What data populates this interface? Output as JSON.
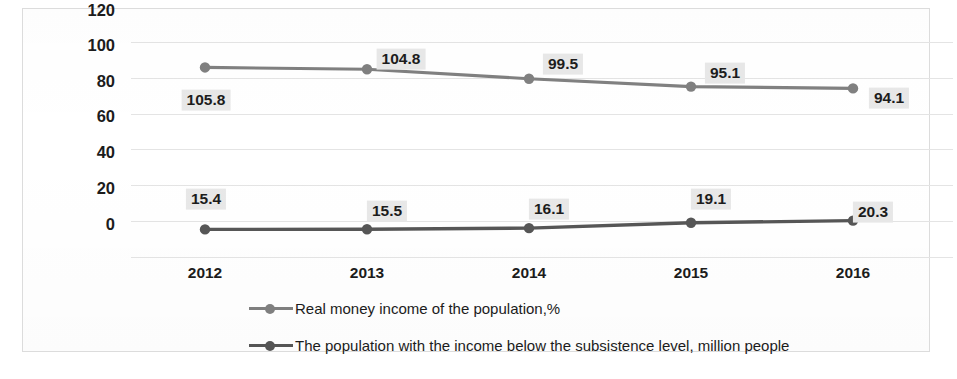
{
  "chart_data": {
    "type": "line",
    "title": "",
    "subtitle": "",
    "xlabel": "",
    "ylabel": "",
    "categories": [
      "2012",
      "2013",
      "2014",
      "2015",
      "2016"
    ],
    "ylim": [
      0,
      120
    ],
    "yticks": [
      0,
      20,
      40,
      60,
      80,
      100,
      120
    ],
    "ytick_labels": [
      "0",
      "20",
      "40",
      "60",
      "80",
      "100",
      "120"
    ],
    "grid": true,
    "legend_position": "bottom",
    "series": [
      {
        "name": "Real money income of the population,%",
        "color": "#808080",
        "values": [
          105.8,
          104.8,
          99.5,
          95.1,
          94.1
        ],
        "data_labels": [
          "105.8",
          "104.8",
          "99.5",
          "95.1",
          "94.1"
        ],
        "label_positions": [
          "below-left",
          "above-right",
          "above",
          "above",
          "right"
        ]
      },
      {
        "name": "The population with the income below the subsistence level, million people",
        "color": "#565656",
        "values": [
          15.4,
          15.5,
          16.1,
          19.1,
          20.3
        ],
        "data_labels": [
          "15.4",
          "15.5",
          "16.1",
          "19.1",
          "20.3"
        ],
        "label_positions": [
          "above-left",
          "above",
          "above",
          "above",
          "above-right"
        ]
      }
    ]
  },
  "legend": {
    "items": [
      {
        "label": "Real money income of the population,%",
        "color": "#808080"
      },
      {
        "label": "The population with the income below the subsistence level, million people",
        "color": "#565656"
      }
    ]
  },
  "axes": {
    "y_tick_0": "0",
    "y_tick_1": "20",
    "y_tick_2": "40",
    "y_tick_3": "60",
    "y_tick_4": "80",
    "y_tick_5": "100",
    "y_tick_6": "120",
    "x_tick_0": "2012",
    "x_tick_1": "2013",
    "x_tick_2": "2014",
    "x_tick_3": "2015",
    "x_tick_4": "2016"
  },
  "colors": {
    "series_light": "#808080",
    "series_dark": "#565656",
    "gridline": "#e4e4e4",
    "label_background": "#e8e8e8",
    "frame_border": "#dcdcdc"
  }
}
